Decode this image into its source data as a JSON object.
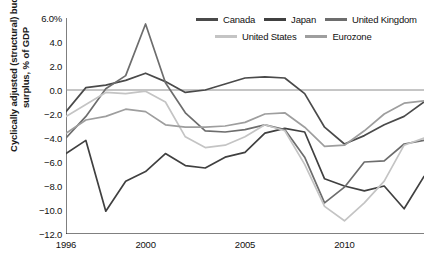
{
  "chart_data": {
    "type": "line",
    "title": "",
    "xlabel": "",
    "ylabel": "Cyclically adjusted (structural) budget surplus, % of GDP",
    "ylim": [
      -12.0,
      6.0
    ],
    "xlim": [
      1996,
      2014
    ],
    "grid": false,
    "zero_line": true,
    "legend_position": "top-right",
    "ytick_labels": [
      "6.0%",
      "4.0",
      "2.0",
      "0.0",
      "-2.0",
      "-4.0",
      "-6.0",
      "-8.0",
      "-10.0",
      "-12.0"
    ],
    "ytick_values": [
      6.0,
      4.0,
      2.0,
      0.0,
      -2.0,
      -4.0,
      -6.0,
      -8.0,
      -10.0,
      -12.0
    ],
    "xtick_labels": [
      "1996",
      "2000",
      "2005",
      "2010"
    ],
    "xtick_values": [
      1996,
      2000,
      2005,
      2010
    ],
    "x": [
      1996,
      1997,
      1998,
      1999,
      2000,
      2001,
      2002,
      2003,
      2004,
      2005,
      2006,
      2007,
      2008,
      2009,
      2010,
      2011,
      2012,
      2013,
      2014
    ],
    "series": [
      {
        "name": "Canada",
        "color": "#4a4a4a",
        "values": [
          -1.8,
          0.2,
          0.4,
          0.8,
          1.4,
          0.7,
          -0.2,
          0.0,
          0.5,
          1.0,
          1.1,
          1.0,
          -0.3,
          -3.1,
          -4.5,
          -3.8,
          -2.9,
          -2.2,
          -1.0
        ]
      },
      {
        "name": "Japan",
        "color": "#404040",
        "values": [
          -5.3,
          -4.2,
          -10.1,
          -7.6,
          -6.8,
          -5.3,
          -6.3,
          -6.5,
          -5.6,
          -5.2,
          -3.6,
          -3.2,
          -3.5,
          -7.4,
          -8.0,
          -8.4,
          -8.0,
          -9.9,
          -7.2
        ]
      },
      {
        "name": "United Kingdom",
        "color": "#6d6d6d",
        "values": [
          -4.0,
          -2.2,
          0.1,
          1.2,
          5.5,
          0.6,
          -1.9,
          -3.4,
          -3.5,
          -3.3,
          -2.9,
          -3.3,
          -5.6,
          -9.4,
          -8.1,
          -6.0,
          -5.9,
          -4.5,
          -4.2
        ]
      },
      {
        "name": "United States",
        "color": "#c4c4c4",
        "values": [
          -2.2,
          -1.2,
          -0.2,
          -0.3,
          -0.1,
          -1.0,
          -3.9,
          -4.8,
          -4.6,
          -3.9,
          -2.9,
          -3.4,
          -6.2,
          -9.7,
          -10.9,
          -9.4,
          -7.6,
          -4.6,
          -4.0
        ]
      },
      {
        "name": "Eurozone",
        "color": "#9e9e9e",
        "values": [
          -3.6,
          -2.5,
          -2.2,
          -1.6,
          -1.8,
          -2.9,
          -3.1,
          -3.1,
          -3.0,
          -2.7,
          -2.0,
          -1.9,
          -3.1,
          -4.7,
          -4.6,
          -3.4,
          -2.0,
          -1.1,
          -0.9
        ]
      }
    ]
  },
  "legend": {
    "row1": [
      {
        "label": "Canada"
      },
      {
        "label": "Japan"
      },
      {
        "label": "United Kingdom"
      }
    ],
    "row2": [
      {
        "label": "United States"
      },
      {
        "label": "Eurozone"
      }
    ]
  }
}
